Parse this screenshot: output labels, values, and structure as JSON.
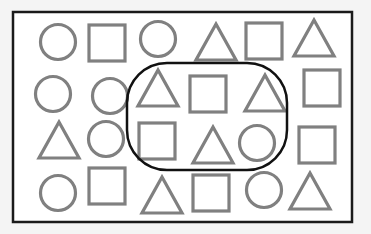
{
  "diagram": {
    "colors": {
      "background": "#f4f4f4",
      "panel": "#ffffff",
      "border": "#1a1a1a",
      "shape_stroke": "#808080",
      "loop_stroke": "#111111"
    },
    "frame": {
      "x": 13,
      "y": 12,
      "w": 339,
      "h": 210
    },
    "loop": {
      "x": 127,
      "y": 63,
      "w": 160,
      "h": 107,
      "rx": 40
    },
    "shapes": [
      {
        "type": "circle",
        "cx": 58,
        "cy": 42,
        "size": 38,
        "in_loop": false
      },
      {
        "type": "square",
        "cx": 107,
        "cy": 43,
        "size": 36,
        "in_loop": false
      },
      {
        "type": "circle",
        "cx": 158,
        "cy": 39,
        "size": 38,
        "in_loop": false
      },
      {
        "type": "triangle",
        "cx": 216,
        "cy": 42,
        "size": 40,
        "in_loop": false
      },
      {
        "type": "square",
        "cx": 264,
        "cy": 41,
        "size": 36,
        "in_loop": false
      },
      {
        "type": "triangle",
        "cx": 314,
        "cy": 38,
        "size": 40,
        "in_loop": false
      },
      {
        "type": "circle",
        "cx": 53,
        "cy": 94,
        "size": 38,
        "in_loop": false
      },
      {
        "type": "circle",
        "cx": 110,
        "cy": 96,
        "size": 38,
        "in_loop": false
      },
      {
        "type": "triangle",
        "cx": 158,
        "cy": 88,
        "size": 40,
        "in_loop": true
      },
      {
        "type": "square",
        "cx": 208,
        "cy": 94,
        "size": 36,
        "in_loop": true
      },
      {
        "type": "triangle",
        "cx": 265,
        "cy": 93,
        "size": 40,
        "in_loop": true
      },
      {
        "type": "square",
        "cx": 322,
        "cy": 88,
        "size": 36,
        "in_loop": false
      },
      {
        "type": "triangle",
        "cx": 59,
        "cy": 140,
        "size": 40,
        "in_loop": false
      },
      {
        "type": "circle",
        "cx": 106,
        "cy": 139,
        "size": 38,
        "in_loop": false
      },
      {
        "type": "square",
        "cx": 157,
        "cy": 141,
        "size": 36,
        "in_loop": true
      },
      {
        "type": "triangle",
        "cx": 213,
        "cy": 145,
        "size": 40,
        "in_loop": true
      },
      {
        "type": "circle",
        "cx": 257,
        "cy": 143,
        "size": 38,
        "in_loop": true
      },
      {
        "type": "square",
        "cx": 317,
        "cy": 145,
        "size": 36,
        "in_loop": false
      },
      {
        "type": "circle",
        "cx": 58,
        "cy": 193,
        "size": 38,
        "in_loop": false
      },
      {
        "type": "square",
        "cx": 107,
        "cy": 186,
        "size": 36,
        "in_loop": false
      },
      {
        "type": "triangle",
        "cx": 162,
        "cy": 195,
        "size": 40,
        "in_loop": false
      },
      {
        "type": "square",
        "cx": 211,
        "cy": 193,
        "size": 36,
        "in_loop": false
      },
      {
        "type": "circle",
        "cx": 264,
        "cy": 190,
        "size": 38,
        "in_loop": false
      },
      {
        "type": "triangle",
        "cx": 310,
        "cy": 191,
        "size": 40,
        "in_loop": false
      }
    ],
    "counts": {
      "total": 24,
      "circles": 8,
      "squares": 8,
      "triangles": 8,
      "in_loop": 6
    }
  }
}
